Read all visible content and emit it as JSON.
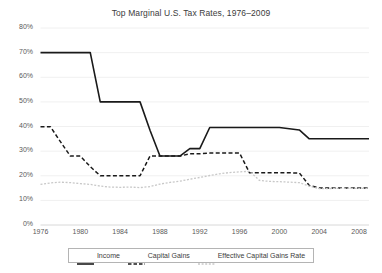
{
  "chart_data": {
    "type": "line",
    "title": "Top Marginal U.S. Tax Rates, 1976–2009",
    "xlabel": "",
    "ylabel": "",
    "xlim": [
      1976,
      2009
    ],
    "ylim": [
      0,
      80
    ],
    "grid": true,
    "grid_axis": "y",
    "legend_position": "bottom",
    "y_ticks": [
      0,
      10,
      20,
      30,
      40,
      50,
      60,
      70,
      80
    ],
    "y_tick_labels": [
      "0%",
      "10%",
      "20%",
      "30%",
      "40%",
      "50%",
      "60%",
      "70%",
      "80%"
    ],
    "x_ticks": [
      1976,
      1980,
      1984,
      1988,
      1992,
      1996,
      2000,
      2004,
      2008
    ],
    "x_tick_labels": [
      "1976",
      "1980",
      "1984",
      "1988",
      "1992",
      "1996",
      "2000",
      "2004",
      "2008"
    ],
    "x": [
      1976,
      1977,
      1978,
      1979,
      1980,
      1981,
      1982,
      1983,
      1984,
      1985,
      1986,
      1987,
      1988,
      1989,
      1990,
      1991,
      1992,
      1993,
      1994,
      1995,
      1996,
      1997,
      1998,
      1999,
      2000,
      2001,
      2002,
      2003,
      2004,
      2005,
      2006,
      2007,
      2008,
      2009
    ],
    "series": [
      {
        "name": "Income",
        "style": "solid",
        "color": "#1a1a1a",
        "values": [
          70,
          70,
          70,
          70,
          70,
          70,
          50,
          50,
          50,
          50,
          50,
          38.5,
          28,
          28,
          28,
          31,
          31,
          39.6,
          39.6,
          39.6,
          39.6,
          39.6,
          39.6,
          39.6,
          39.6,
          39.1,
          38.6,
          35,
          35,
          35,
          35,
          35,
          35,
          35
        ]
      },
      {
        "name": "Capital Gains",
        "style": "dashed",
        "color": "#1a1a1a",
        "values": [
          39.875,
          39.875,
          33.85,
          28,
          28,
          23.7,
          20,
          20,
          20,
          20,
          20,
          28,
          28,
          28,
          28,
          28.93,
          28.93,
          29.19,
          29.19,
          29.19,
          29.19,
          21.19,
          21.19,
          21.19,
          21.19,
          21.17,
          21.16,
          16.05,
          15,
          15,
          15,
          15,
          15,
          15
        ]
      },
      {
        "name": "Effective Capital Gains Rate",
        "style": "dotted",
        "color": "#c8c8c8",
        "values": [
          16.5,
          17.1,
          17.4,
          17.2,
          16.8,
          16.5,
          15.8,
          15.4,
          15.3,
          15.4,
          15.2,
          15.6,
          16.6,
          17.3,
          17.8,
          18.6,
          19.3,
          20.1,
          20.8,
          21.3,
          21.6,
          21.8,
          18.1,
          17.7,
          17.6,
          17.4,
          17.2,
          15.8,
          14.8,
          14.8,
          14.9,
          14.9,
          14.9,
          14.9
        ]
      }
    ]
  },
  "legend": {
    "items": [
      {
        "label": "Income",
        "swatch": "solid-line-swatch"
      },
      {
        "label": "Capital Gains",
        "swatch": "dashed-line-swatch"
      },
      {
        "label": "Effective Capital Gains Rate",
        "swatch": "dotted-line-swatch"
      }
    ]
  }
}
